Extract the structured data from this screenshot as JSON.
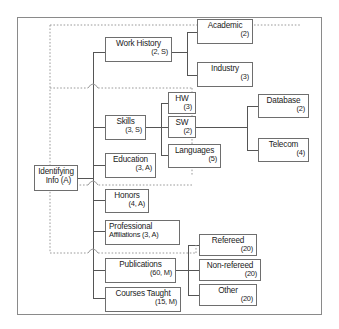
{
  "diagram": {
    "colors": {
      "frame_border": "#8a8a8a",
      "node_border": "#6e6e6e",
      "connector": "#555555",
      "dotted_overlay": "#9a9a9a",
      "text": "#1b1b1b",
      "background": "#ffffff"
    },
    "nodes": {
      "root": {
        "label": "Identifying",
        "sub": "Info  (A)"
      },
      "work_history": {
        "label": "Work History",
        "sub": "(2, S)"
      },
      "academic": {
        "label": "Academic",
        "sub": "(2)"
      },
      "industry": {
        "label": "Industry",
        "sub": "(3)"
      },
      "skills": {
        "label": "Skills",
        "sub": "(3, S)"
      },
      "hw": {
        "label": "HW",
        "sub": "(3)"
      },
      "sw": {
        "label": "SW",
        "sub": "(2)"
      },
      "languages": {
        "label": "Languages",
        "sub": "(5)"
      },
      "database": {
        "label": "Database",
        "sub": "(2)"
      },
      "telecom": {
        "label": "Telecom",
        "sub": "(4)"
      },
      "education": {
        "label": "Education",
        "sub": "(3, A)"
      },
      "honors": {
        "label": "Honors",
        "sub": "(4, A)"
      },
      "professional_affiliations": {
        "label": "Professional",
        "sub": "Affiliations (3, A)"
      },
      "publications": {
        "label": "Publications",
        "sub": "(60, M)"
      },
      "refereed": {
        "label": "Refereed",
        "sub": "(20)"
      },
      "non_refereed": {
        "label": "Non-refereed",
        "sub": "(20)"
      },
      "other": {
        "label": "Other",
        "sub": "(20)"
      },
      "courses_taught": {
        "label": "Courses Taught",
        "sub": "(15, M)"
      }
    }
  }
}
